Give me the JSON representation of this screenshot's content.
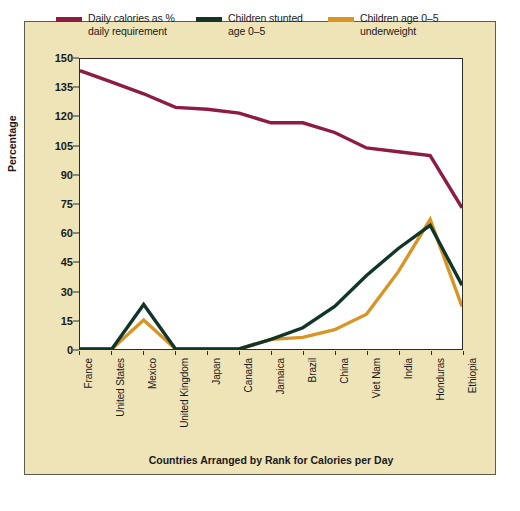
{
  "chart_data": {
    "type": "line",
    "title": "",
    "xlabel": "Countries Arranged by Rank for Calories per Day",
    "ylabel": "Percentage",
    "categories": [
      "France",
      "United States",
      "Mexico",
      "United Kingdom",
      "Japan",
      "Canada",
      "Jamaica",
      "Brazil",
      "China",
      "Viet Nam",
      "India",
      "Honduras",
      "Ethiopia"
    ],
    "ylim": [
      0,
      150
    ],
    "yticks": [
      0,
      15,
      30,
      45,
      60,
      75,
      90,
      105,
      120,
      135,
      150
    ],
    "grid": false,
    "legend_position": "top",
    "series": [
      {
        "name": "Daily calories as %\ndaily requirement",
        "color": "#8e1b43",
        "values": [
          144,
          138,
          132,
          125,
          124,
          122,
          117,
          117,
          112,
          104,
          102,
          100,
          73
        ]
      },
      {
        "name": "Children stunted\nage 0–5",
        "color": "#12352a",
        "values": [
          0,
          0,
          23,
          0,
          0,
          0,
          5,
          11,
          22,
          38,
          52,
          64,
          33
        ]
      },
      {
        "name": "Children age 0–5\nunderweight",
        "color": "#d99524",
        "values": [
          0,
          0,
          15,
          0,
          0,
          0,
          5,
          6,
          10,
          18,
          40,
          67,
          22
        ]
      }
    ],
    "series_plot_order": [
      {
        "name": "underweight",
        "values": [
          0,
          0,
          15,
          0,
          0,
          0,
          5,
          6,
          10,
          18,
          40,
          67,
          22,
          50
        ]
      },
      {
        "name": "stunted",
        "values": [
          0,
          0,
          23,
          0,
          0,
          0,
          5,
          11,
          22,
          38,
          52,
          64,
          33,
          64
        ]
      }
    ]
  },
  "legend": {
    "items": [
      {
        "label": "Daily calories as %\ndaily requirement",
        "color": "#8e1b43",
        "name": "legend-daily-calories"
      },
      {
        "label": "Children stunted\nage 0–5",
        "color": "#12352a",
        "name": "legend-children-stunted"
      },
      {
        "label": "Children age 0–5\nunderweight",
        "color": "#d99524",
        "name": "legend-children-underweight"
      }
    ]
  },
  "axes": {
    "y_title": "Percentage",
    "y_ticks": [
      "150",
      "135",
      "120",
      "105",
      "90",
      "75",
      "60",
      "45",
      "30",
      "15",
      "0"
    ],
    "x_title": "Countries Arranged by Rank for Calories per Day",
    "x_ticks": [
      "France",
      "United States",
      "Mexico",
      "United Kingdom",
      "Japan",
      "Canada",
      "Jamaica",
      "Brazil",
      "China",
      "Viet Nam",
      "India",
      "Honduras",
      "Ethiopia"
    ]
  },
  "colors": {
    "panel_background": "#efe4b8",
    "plot_background": "#ffffff",
    "axis": "#2b2b2b",
    "purple": "#8e1b43",
    "green": "#12352a",
    "orange": "#d99524"
  }
}
